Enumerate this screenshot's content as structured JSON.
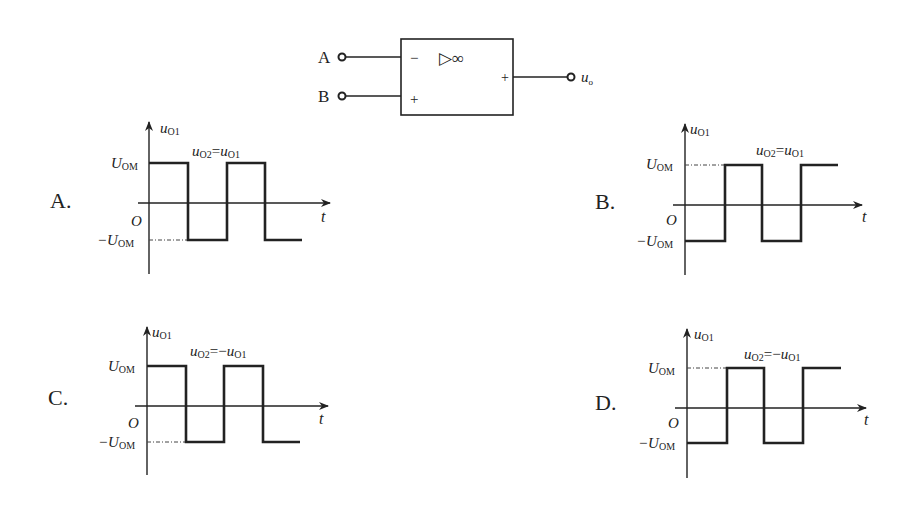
{
  "opamp": {
    "input_a": "A",
    "input_b": "B",
    "minus": "−",
    "plus_in": "+",
    "plus_out": "+",
    "symbol": "▷∞",
    "output": "u",
    "output_sub": "o"
  },
  "axes": {
    "y_label": "u",
    "y_sub": "O1",
    "x_label": "t",
    "origin": "O",
    "high_label": "U",
    "high_sub": "OM",
    "low_label": "−U",
    "low_sub": "OM"
  },
  "options": [
    {
      "letter": "A.",
      "relation_lhs": "u",
      "lhs_sub": "O2",
      "relation_op": "=",
      "relation_rhs": "u",
      "rhs_sub": "O1",
      "starts_high": true
    },
    {
      "letter": "B.",
      "relation_lhs": "u",
      "lhs_sub": "O2",
      "relation_op": "=",
      "relation_rhs": "u",
      "rhs_sub": "O1",
      "starts_high": false
    },
    {
      "letter": "C.",
      "relation_lhs": "u",
      "lhs_sub": "O2",
      "relation_op": "=−",
      "relation_rhs": "u",
      "rhs_sub": "O1",
      "starts_high": true
    },
    {
      "letter": "D.",
      "relation_lhs": "u",
      "lhs_sub": "O2",
      "relation_op": "=−",
      "relation_rhs": "u",
      "rhs_sub": "O1",
      "starts_high": false
    }
  ]
}
